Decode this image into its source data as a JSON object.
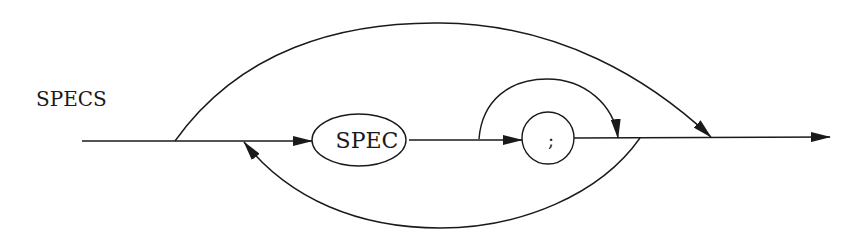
{
  "diagram": {
    "type": "syntax-diagram",
    "title": "SPECS",
    "nodes": [
      {
        "id": "spec",
        "label": "SPEC",
        "shape": "ellipse"
      },
      {
        "id": "semicolon",
        "label": ";",
        "shape": "circle"
      }
    ],
    "edges": [
      {
        "from": "entry",
        "to": "spec",
        "kind": "main-line"
      },
      {
        "from": "spec",
        "to": "semicolon",
        "kind": "main-line"
      },
      {
        "from": "semicolon",
        "to": "exit",
        "kind": "main-line"
      },
      {
        "from": "entry",
        "to": "exit",
        "kind": "bypass-all"
      },
      {
        "from": "after-spec",
        "to": "after-semicolon",
        "kind": "bypass-semicolon"
      },
      {
        "from": "after-semicolon",
        "to": "before-spec",
        "kind": "repeat-loop"
      }
    ],
    "colors": {
      "stroke": "#1a1a1a",
      "background": "#ffffff"
    }
  }
}
